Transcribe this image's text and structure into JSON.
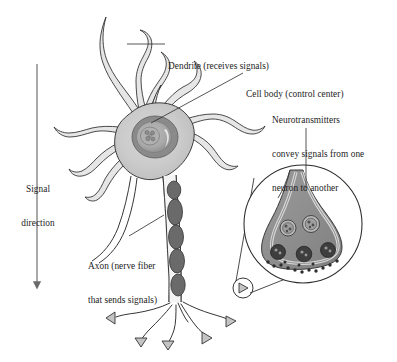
{
  "figure": {
    "type": "anatomical-diagram",
    "subject": "neuron",
    "background_color": "#ffffff",
    "width": 397,
    "height": 362
  },
  "labels": {
    "dendrite": {
      "text": "Dendrite (receives signals)",
      "lines": [
        "Dendrite (receives signals)"
      ]
    },
    "cell_body": {
      "text": "Cell body (control center)",
      "lines": [
        "Cell body (control center)"
      ]
    },
    "neurotransmitters": {
      "text": "Neurotransmitters convey signals from one neuron to another",
      "lines": [
        "Neurotransmitters",
        "convey signals from one",
        "neuron to another"
      ]
    },
    "axon": {
      "text": "Axon (nerve fiber that sends signals)",
      "lines": [
        "Axon (nerve fiber",
        "that sends signals)"
      ]
    },
    "signal_direction": {
      "text": "Signal direction",
      "lines": [
        "Signal",
        "direction"
      ]
    }
  },
  "colors": {
    "outline": "#2b2b2b",
    "text": "#1c1c1c",
    "soma_fill": "#c9c9c9",
    "soma_fill_light": "#d8d8d8",
    "nucleus_ring": "#8a8a8a",
    "nucleus_inner": "#b4b4b4",
    "nucleolus": "#9a9a9a",
    "myelin": "#6f6f6f",
    "dendrite_fill": "#e2e2e2",
    "terminal_fill": "#c4c4c4",
    "inset_bulb": "#8f8f8f",
    "inset_bulb_light": "#c2c2c2",
    "vesicle_dark": "#3a3a3a",
    "arrow": "#6b6b6b"
  },
  "parts": {
    "soma": "cell body",
    "nucleus": "nucleus",
    "nucleolus": "nucleolus",
    "dendrites_count": 9,
    "myelin_segments": 5,
    "axon_terminals": 5,
    "inset_vesicles_upper": 2,
    "inset_vesicles_lower": 3
  },
  "inset": {
    "name": "synaptic terminal magnification",
    "shape": "circle",
    "center_x": 303,
    "center_y": 224,
    "radius": 59,
    "source_marker_x": 243,
    "source_marker_y": 288,
    "source_marker_radius": 10
  },
  "signal_arrow": {
    "x": 37,
    "y_start": 64,
    "y_end": 292,
    "direction": "down"
  }
}
